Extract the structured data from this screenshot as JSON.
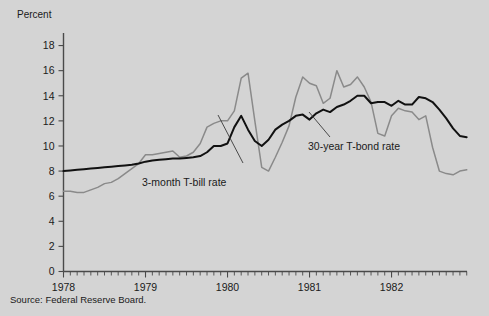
{
  "figure": {
    "background_color": "#d4d4d4",
    "source_note": "Source:  Federal Reserve Board."
  },
  "chart_data": {
    "type": "line",
    "title": "",
    "xlabel": "",
    "ylabel": "Percent",
    "ylim": [
      0,
      19
    ],
    "xlim": [
      1978.0,
      1982.92
    ],
    "yticks": [
      0,
      2,
      4,
      6,
      8,
      10,
      12,
      14,
      16,
      18
    ],
    "ytick_labels": [
      "0",
      "2",
      "4",
      "6",
      "8",
      "10",
      "12",
      "14",
      "16",
      "18"
    ],
    "xticks": [
      1978,
      1979,
      1980,
      1981,
      1982
    ],
    "xtick_labels": [
      "1978",
      "1979",
      "1980",
      "1981",
      "1982"
    ],
    "minor_xticks_per_year": 12,
    "grid": false,
    "legend_position": "inline-annotation",
    "annotations": [
      {
        "name": "tbill-annotation",
        "text": "3-month T-bill rate",
        "x": 1979.45,
        "y": 4.6
      },
      {
        "name": "tbond-annotation",
        "text": "30-year T-bond rate",
        "x": 1981.15,
        "y": 9.6
      }
    ],
    "series": [
      {
        "name": "30-year T-bond rate",
        "color": "#111111",
        "x": [
          1978.0,
          1978.083,
          1978.167,
          1978.25,
          1978.333,
          1978.417,
          1978.5,
          1978.583,
          1978.667,
          1978.75,
          1978.833,
          1978.917,
          1979.0,
          1979.083,
          1979.167,
          1979.25,
          1979.333,
          1979.417,
          1979.5,
          1979.583,
          1979.667,
          1979.75,
          1979.833,
          1979.917,
          1980.0,
          1980.083,
          1980.167,
          1980.25,
          1980.333,
          1980.417,
          1980.5,
          1980.583,
          1980.667,
          1980.75,
          1980.833,
          1980.917,
          1981.0,
          1981.083,
          1981.167,
          1981.25,
          1981.333,
          1981.417,
          1981.5,
          1981.583,
          1981.667,
          1981.75,
          1981.833,
          1981.917,
          1982.0,
          1982.083,
          1982.167,
          1982.25,
          1982.333,
          1982.417,
          1982.5,
          1982.583,
          1982.667,
          1982.75,
          1982.833,
          1982.917
        ],
        "values": [
          8.0,
          8.05,
          8.1,
          8.15,
          8.2,
          8.25,
          8.3,
          8.35,
          8.4,
          8.45,
          8.5,
          8.6,
          8.75,
          8.85,
          8.9,
          8.95,
          9.0,
          9.0,
          9.05,
          9.1,
          9.2,
          9.5,
          10.0,
          10.0,
          10.2,
          11.5,
          12.4,
          11.3,
          10.4,
          10.0,
          10.5,
          11.3,
          11.7,
          12.0,
          12.4,
          12.5,
          12.1,
          12.6,
          12.9,
          12.7,
          13.1,
          13.3,
          13.6,
          14.0,
          14.0,
          13.4,
          13.5,
          13.5,
          13.2,
          13.6,
          13.3,
          13.3,
          13.9,
          13.8,
          13.5,
          12.9,
          12.2,
          11.4,
          10.8,
          10.7
        ],
        "notes": "Rises steadily from 8% in early 1978, reaching ~14% in late 1981, then declining to ~10.7% by end of 1982."
      },
      {
        "name": "3-month T-bill rate",
        "color": "#8a8a8a",
        "x": [
          1978.0,
          1978.083,
          1978.167,
          1978.25,
          1978.333,
          1978.417,
          1978.5,
          1978.583,
          1978.667,
          1978.75,
          1978.833,
          1978.917,
          1979.0,
          1979.083,
          1979.167,
          1979.25,
          1979.333,
          1979.417,
          1979.5,
          1979.583,
          1979.667,
          1979.75,
          1979.833,
          1979.917,
          1980.0,
          1980.083,
          1980.167,
          1980.25,
          1980.333,
          1980.417,
          1980.5,
          1980.583,
          1980.667,
          1980.75,
          1980.833,
          1980.917,
          1981.0,
          1981.083,
          1981.167,
          1981.25,
          1981.333,
          1981.417,
          1981.5,
          1981.583,
          1981.667,
          1981.75,
          1981.833,
          1981.917,
          1982.0,
          1982.083,
          1982.167,
          1982.25,
          1982.333,
          1982.417,
          1982.5,
          1982.583,
          1982.667,
          1982.75,
          1982.833,
          1982.917
        ],
        "values": [
          6.4,
          6.4,
          6.3,
          6.3,
          6.5,
          6.7,
          7.0,
          7.1,
          7.4,
          7.8,
          8.2,
          8.6,
          9.3,
          9.3,
          9.4,
          9.5,
          9.6,
          9.1,
          9.2,
          9.5,
          10.2,
          11.5,
          11.8,
          12.0,
          12.0,
          12.8,
          15.4,
          15.8,
          12.0,
          8.3,
          8.0,
          9.1,
          10.3,
          11.6,
          13.9,
          15.5,
          15.0,
          14.8,
          13.4,
          13.8,
          16.0,
          14.7,
          14.9,
          15.5,
          14.7,
          13.5,
          11.0,
          10.8,
          12.4,
          13.0,
          12.8,
          12.7,
          12.1,
          12.4,
          9.9,
          8.0,
          7.8,
          7.7,
          8.0,
          8.1
        ],
        "notes": "Highly volatile; spikes to ~15.8% in spring 1980, crashes to ~8% by mid-1980, peaks near 16% in mid-1981, then falls to ~8% by late 1982."
      }
    ]
  }
}
